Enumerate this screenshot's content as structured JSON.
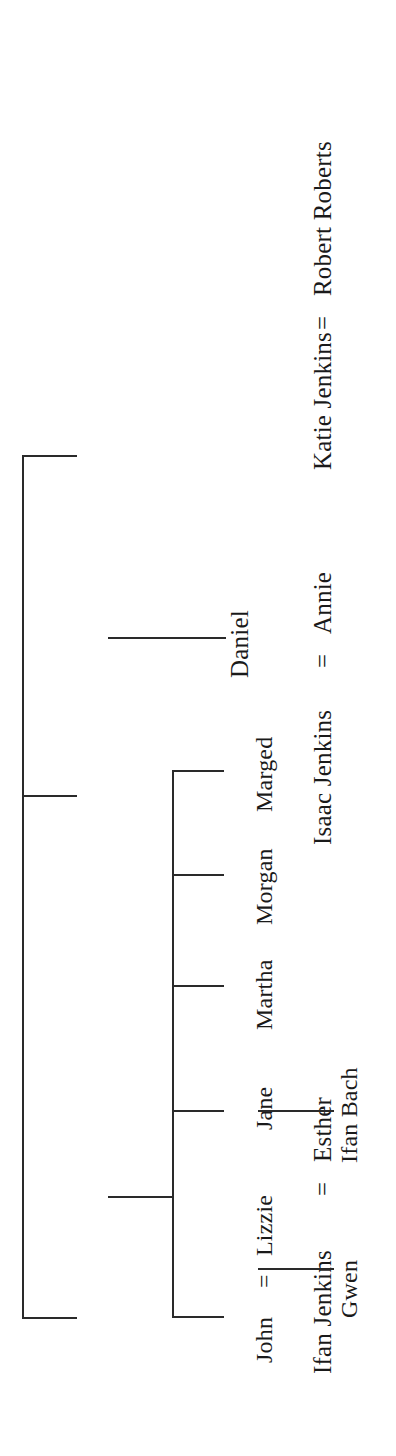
{
  "diagram": {
    "orientation": "rotated-90-ccw",
    "background_color": "#ffffff",
    "line_color": "#2a2a2a",
    "text_color": "#1a1a1a",
    "marriage_symbol": "=",
    "generations": {
      "gen1": {
        "label": "children of the first generation",
        "people": [
          {
            "id": "ifan",
            "text": "Ifan Jenkins"
          },
          {
            "id": "isaac",
            "text": "Isaac Jenkins"
          },
          {
            "id": "katie",
            "text": "Katie Jenkins"
          }
        ]
      },
      "gen1_spouses": [
        {
          "id": "esther",
          "text": "Esther",
          "married_to": "Ifan Jenkins"
        },
        {
          "id": "annie",
          "text": "Annie",
          "married_to": "Isaac Jenkins"
        },
        {
          "id": "robert",
          "text": "Robert Roberts",
          "married_to": "Katie Jenkins"
        }
      ],
      "gen2": {
        "label": "children of Ifan Jenkins = Esther",
        "people": [
          {
            "id": "john",
            "text": "John"
          },
          {
            "id": "jane",
            "text": "Jane"
          },
          {
            "id": "martha",
            "text": "Martha"
          },
          {
            "id": "morgan",
            "text": "Morgan"
          },
          {
            "id": "marged",
            "text": "Marged"
          }
        ]
      },
      "gen2_other": [
        {
          "id": "daniel",
          "text": "Daniel",
          "child_of": "Isaac Jenkins = Annie"
        }
      ],
      "gen2_spouses": [
        {
          "id": "lizzie",
          "text": "Lizzie",
          "married_to": "John"
        }
      ],
      "gen3": [
        {
          "id": "gwen",
          "text": "Gwen",
          "child_of": "John = Lizzie"
        },
        {
          "id": "ifan_bach",
          "text": "Ifan Bach",
          "child_of": "Jane"
        }
      ]
    },
    "marriage_marks": [
      {
        "id": "eq-ifan-esther",
        "text": "="
      },
      {
        "id": "eq-isaac-annie",
        "text": "="
      },
      {
        "id": "eq-katie-robert",
        "text": "="
      },
      {
        "id": "eq-john-lizzie",
        "text": "="
      }
    ]
  }
}
